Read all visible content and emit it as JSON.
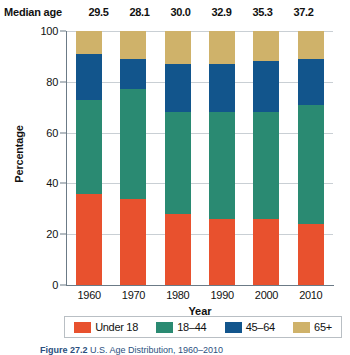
{
  "median_age": {
    "label": "Median age",
    "values": [
      "29.5",
      "28.1",
      "30.0",
      "32.9",
      "35.3",
      "37.2"
    ]
  },
  "caption": {
    "bold": "Figure 27.2",
    "rest": " U.S. Age Distribution, 1960–2010"
  },
  "colors": {
    "under18": "#E8512E",
    "age18_44": "#2A8A72",
    "age45_64": "#12558C",
    "age65plus": "#CFB26A",
    "axis": "#6b7a86",
    "grid": "#c9cfd4"
  },
  "chart_data": {
    "type": "bar",
    "subtype": "stacked-column-100",
    "title": "",
    "xlabel": "Year",
    "ylabel": "Percentage",
    "ylim": [
      0,
      100
    ],
    "yticks": [
      0,
      20,
      40,
      60,
      80,
      100
    ],
    "ytick_labels": [
      "0",
      "20",
      "40",
      "60",
      "80",
      "100"
    ],
    "grid": true,
    "legend_position": "bottom",
    "categories": [
      "1960",
      "1970",
      "1980",
      "1990",
      "2000",
      "2010"
    ],
    "series": [
      {
        "name": "Under 18",
        "color": "#E8512E",
        "values": [
          36,
          34,
          28,
          26,
          26,
          24
        ]
      },
      {
        "name": "18–44",
        "color": "#2A8A72",
        "values": [
          37,
          43,
          40,
          42,
          42,
          47
        ]
      },
      {
        "name": "45–64",
        "color": "#12558C",
        "values": [
          18,
          12,
          19,
          19,
          20,
          18
        ]
      },
      {
        "name": "65+",
        "color": "#CFB26A",
        "values": [
          9,
          11,
          13,
          13,
          12,
          11
        ]
      }
    ],
    "annotations": {
      "median_age_row": {
        "label": "Median age",
        "values": [
          29.5,
          28.1,
          30.0,
          32.9,
          35.3,
          37.2
        ]
      }
    }
  }
}
